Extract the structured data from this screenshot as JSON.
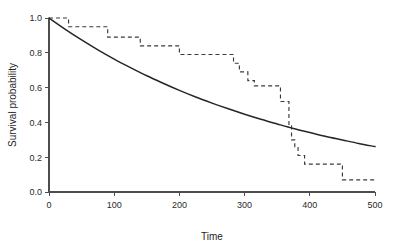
{
  "figure": {
    "background_color": "#ffffff",
    "width": 414,
    "height": 246
  },
  "chart_data": {
    "type": "line",
    "title": "",
    "subtitle": "",
    "xlabel": "Time",
    "ylabel": "Survival  probability",
    "xlim": [
      0,
      500
    ],
    "ylim": [
      0.0,
      1.0
    ],
    "xticks": [
      0,
      100,
      200,
      300,
      400,
      500
    ],
    "xtick_labels": [
      "0",
      "100",
      "200",
      "300",
      "400",
      "500"
    ],
    "yticks": [
      0.0,
      0.2,
      0.4,
      0.6,
      0.8,
      1.0
    ],
    "ytick_labels": [
      "0.0",
      "0.2",
      "0.4",
      "0.6",
      "0.8",
      "1.0"
    ],
    "grid": false,
    "legend": false,
    "legend_position": "none",
    "series": [
      {
        "name": "Fitted exponential survival curve",
        "style": "solid",
        "color": "#262626",
        "linewidth": 1.5,
        "interpolation": "smooth",
        "model": "exponential",
        "rate_lambda": 0.00269,
        "x": [
          0,
          25,
          50,
          75,
          100,
          125,
          150,
          175,
          200,
          225,
          250,
          275,
          300,
          325,
          350,
          375,
          400,
          425,
          450,
          475,
          500
        ],
        "y": [
          1.0,
          0.935,
          0.874,
          0.817,
          0.764,
          0.715,
          0.668,
          0.625,
          0.584,
          0.546,
          0.511,
          0.478,
          0.447,
          0.418,
          0.391,
          0.365,
          0.342,
          0.319,
          0.299,
          0.279,
          0.261
        ]
      },
      {
        "name": "Kaplan-Meier empirical survival estimate",
        "style": "dashed",
        "color": "#3a3a3a",
        "linewidth": 1.15,
        "interpolation": "step-post",
        "x": [
          0,
          30,
          90,
          140,
          200,
          283,
          292,
          305,
          315,
          355,
          368,
          372,
          377,
          382,
          392,
          450,
          500
        ],
        "y": [
          1.0,
          0.95,
          0.89,
          0.84,
          0.79,
          0.74,
          0.69,
          0.64,
          0.61,
          0.52,
          0.38,
          0.3,
          0.26,
          0.21,
          0.16,
          0.07,
          0.07
        ],
        "steps": [
          {
            "t_start": 0,
            "t_end": 30,
            "survival": 1.0
          },
          {
            "t_start": 30,
            "t_end": 90,
            "survival": 0.95
          },
          {
            "t_start": 90,
            "t_end": 140,
            "survival": 0.89
          },
          {
            "t_start": 140,
            "t_end": 200,
            "survival": 0.84
          },
          {
            "t_start": 200,
            "t_end": 283,
            "survival": 0.79
          },
          {
            "t_start": 283,
            "t_end": 292,
            "survival": 0.74
          },
          {
            "t_start": 292,
            "t_end": 305,
            "survival": 0.69
          },
          {
            "t_start": 305,
            "t_end": 315,
            "survival": 0.64
          },
          {
            "t_start": 315,
            "t_end": 355,
            "survival": 0.61
          },
          {
            "t_start": 355,
            "t_end": 368,
            "survival": 0.52
          },
          {
            "t_start": 368,
            "t_end": 372,
            "survival": 0.38
          },
          {
            "t_start": 372,
            "t_end": 377,
            "survival": 0.3
          },
          {
            "t_start": 377,
            "t_end": 382,
            "survival": 0.26
          },
          {
            "t_start": 382,
            "t_end": 392,
            "survival": 0.21
          },
          {
            "t_start": 392,
            "t_end": 450,
            "survival": 0.16
          },
          {
            "t_start": 450,
            "t_end": 500,
            "survival": 0.07
          }
        ]
      }
    ],
    "annotations": []
  }
}
